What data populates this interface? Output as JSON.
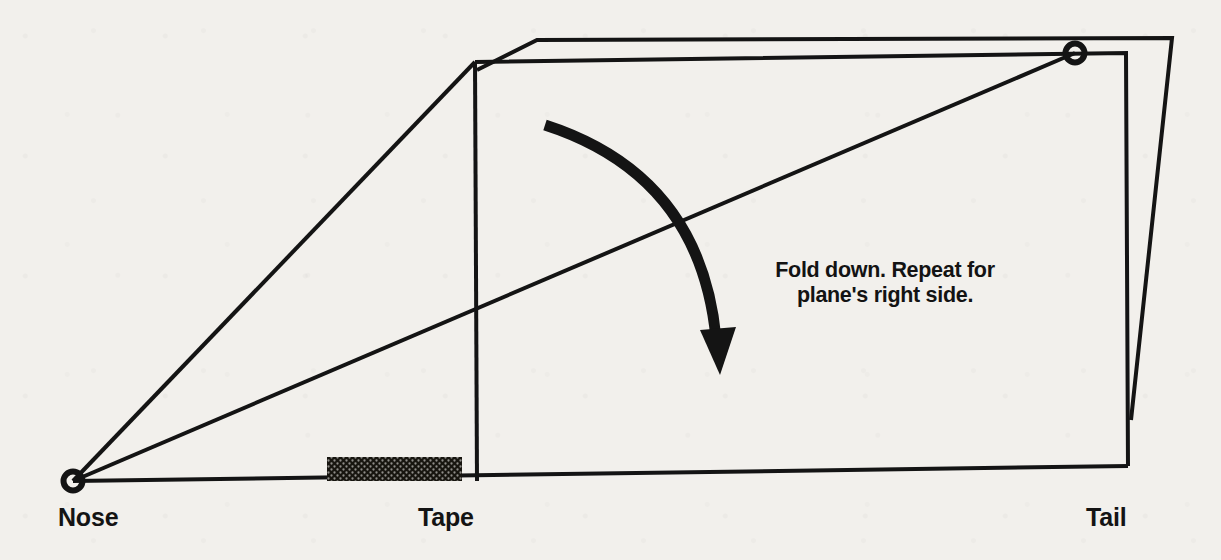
{
  "diagram": {
    "background_color": "#f2f0ec",
    "ink_color": "#141414",
    "labels": {
      "nose": "Nose",
      "tape": "Tape",
      "tail": "Tail"
    },
    "instruction": {
      "line1": "Fold down. Repeat for",
      "line2": "plane's right side."
    },
    "markers": {
      "nose_point": "nose-vertex-marker",
      "tail_point": "fold-corner-marker"
    },
    "geometry": {
      "nose_vertex": [
        73,
        481
      ],
      "fold_corner": [
        1075,
        53
      ],
      "inner_top_left": [
        475,
        62
      ],
      "inner_top_right": [
        1126,
        53
      ],
      "inner_bottom_left": [
        477,
        481
      ],
      "inner_bottom_right": [
        1128,
        466
      ],
      "outer_top_left": [
        537,
        40
      ],
      "outer_top_right": [
        1172,
        38
      ],
      "outer_bottom_right": [
        1131,
        420
      ],
      "tape_block": [
        327,
        457,
        462,
        481
      ],
      "arrow_start": [
        545,
        125
      ],
      "arrow_tip": [
        720,
        373
      ]
    }
  }
}
